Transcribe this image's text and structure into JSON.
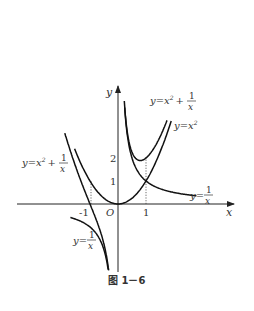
{
  "figure": {
    "caption": "图 1－6",
    "axes": {
      "x_label": "x",
      "y_label": "y",
      "origin_label": "O",
      "x_ticks": [
        {
          "value": -1,
          "label": "-1"
        },
        {
          "value": 1,
          "label": "1"
        }
      ],
      "y_ticks": [
        {
          "value": 1,
          "label": "1"
        },
        {
          "value": 2,
          "label": "2"
        }
      ]
    },
    "curves": [
      {
        "name": "y=x^2",
        "expr": "x^2",
        "label": "y=x²"
      },
      {
        "name": "y=1/x",
        "expr": "1/x",
        "label": "y=1/x"
      },
      {
        "name": "y=x^2+1/x",
        "expr": "x^2+1/x",
        "label": "y=x²+1/x"
      }
    ],
    "labels": {
      "sum_right": {
        "prefix": "y=x",
        "sup": "2",
        "plus": "+",
        "num": "1",
        "den": "x"
      },
      "sum_left": {
        "prefix": "y=x",
        "sup": "2",
        "plus": "+",
        "num": "1",
        "den": "x"
      },
      "square": {
        "prefix": "y=x",
        "sup": "2"
      },
      "recip_right": {
        "prefix": "y=",
        "num": "1",
        "den": "x"
      },
      "recip_left": {
        "prefix": "y=",
        "num": "1",
        "den": "x"
      }
    }
  },
  "chart_data": {
    "type": "line",
    "title": "图 1－6",
    "xlabel": "x",
    "ylabel": "y",
    "xlim": [
      -1.9,
      4
    ],
    "ylim": [
      -3,
      5
    ],
    "grid": false,
    "series": [
      {
        "name": "y=x²",
        "function": "x^2",
        "domain": [
          -1.55,
          1.9
        ]
      },
      {
        "name": "y=1/x",
        "function": "1/x",
        "domain": [
          [
            -1.7,
            -0.08
          ],
          [
            0.15,
            2.8
          ]
        ]
      },
      {
        "name": "y=x²+1/x",
        "function": "x^2+1/x",
        "domain": [
          [
            -1.9,
            -0.11
          ],
          [
            0.2,
            1.75
          ]
        ]
      }
    ],
    "annotations": [
      {
        "text": "dotted guide",
        "x": -1,
        "y_from": 0,
        "y_to": 1
      },
      {
        "text": "dotted guide",
        "x": 1,
        "y_from": 0,
        "y_to": 2
      },
      {
        "point": [
          1,
          1
        ],
        "note": "y=x² and y=1/x intersect"
      },
      {
        "point": [
          -1,
          0
        ],
        "note": "y=x²+1/x crosses x-axis"
      }
    ]
  }
}
